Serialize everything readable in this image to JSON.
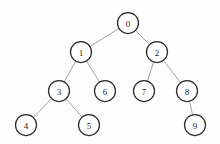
{
  "figure": {
    "background_color": "#fdfdfd",
    "node_fill_color": "#ffffff",
    "node_stroke_color": "#2b2b2b",
    "edge_color": "#9a9a9a",
    "label_color": "#1a1a1a",
    "node_radius": 10.5
  },
  "chart_data": {
    "type": "diagram",
    "diagram_kind": "binary-tree",
    "title": "",
    "node_count": 10,
    "edge_count": 9,
    "root": "0",
    "nodes": [
      {
        "id": "0",
        "label": "0",
        "x": 128,
        "y": 23,
        "depth": 0
      },
      {
        "id": "1",
        "label": "1",
        "x": 81,
        "y": 52,
        "depth": 1
      },
      {
        "id": "2",
        "label": "2",
        "x": 157,
        "y": 52,
        "depth": 1
      },
      {
        "id": "3",
        "label": "3",
        "x": 59,
        "y": 91,
        "depth": 2
      },
      {
        "id": "6",
        "label": "6",
        "x": 105,
        "y": 91,
        "depth": 2
      },
      {
        "id": "7",
        "label": "7",
        "x": 144,
        "y": 91,
        "depth": 2
      },
      {
        "id": "8",
        "label": "8",
        "x": 187,
        "y": 91,
        "depth": 2
      },
      {
        "id": "4",
        "label": "4",
        "x": 26,
        "y": 125,
        "depth": 3
      },
      {
        "id": "5",
        "label": "5",
        "x": 89,
        "y": 125,
        "depth": 3
      },
      {
        "id": "9",
        "label": "9",
        "x": 195,
        "y": 125,
        "depth": 3
      }
    ],
    "edges": [
      {
        "from": "0",
        "to": "1",
        "side": "left"
      },
      {
        "from": "0",
        "to": "2",
        "side": "right"
      },
      {
        "from": "1",
        "to": "3",
        "side": "left"
      },
      {
        "from": "1",
        "to": "6",
        "side": "right"
      },
      {
        "from": "2",
        "to": "7",
        "side": "left"
      },
      {
        "from": "2",
        "to": "8",
        "side": "right"
      },
      {
        "from": "3",
        "to": "4",
        "side": "left"
      },
      {
        "from": "3",
        "to": "5",
        "side": "right"
      },
      {
        "from": "8",
        "to": "9",
        "side": "right"
      }
    ]
  }
}
